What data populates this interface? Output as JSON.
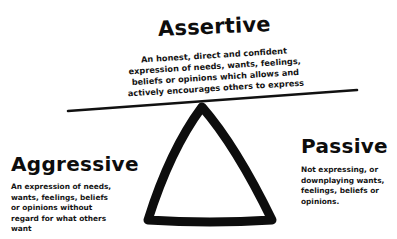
{
  "diagram": {
    "type": "triangle-balance",
    "colors": {
      "background": "#ffffff",
      "ink": "#111111"
    },
    "nodes": [
      {
        "id": "assertive",
        "position": "top",
        "title": "Assertive",
        "description_lines": [
          "An honest, direct and confident",
          "expression of needs, wants, feelings,",
          "beliefs or opinions which allows and",
          "actively encourages others to express"
        ]
      },
      {
        "id": "aggressive",
        "position": "left",
        "title": "Aggressive",
        "description_lines": [
          "An expression of needs,",
          "wants, feelings, beliefs",
          "or opinions  without",
          "regard for what others",
          "want"
        ]
      },
      {
        "id": "passive",
        "position": "right",
        "title": "Passive",
        "description_lines": [
          "Not expressing, or",
          "downplaying wants,",
          "feelings, beliefs or",
          "opinions."
        ]
      }
    ],
    "shapes": {
      "balance_line": {
        "x1": 68,
        "y1": 111,
        "x2": 357,
        "y2": 90
      },
      "triangle": {
        "apex": [
          202,
          106
        ],
        "base_left": [
          146,
          222
        ],
        "base_right": [
          274,
          222
        ]
      }
    }
  }
}
